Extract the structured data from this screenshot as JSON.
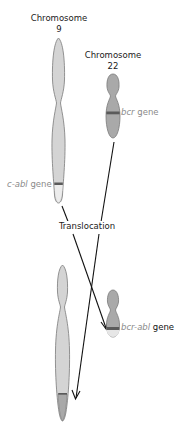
{
  "diagram": {
    "type": "chromosome-translocation",
    "colors": {
      "chromosome9": "#d4d4d4",
      "chromosome22": "#a9a9a9",
      "outline": "#7a7a7a",
      "band": "#5a5a5a",
      "arrow": "#111111",
      "gene_label": "#8a8a8a",
      "text": "#1a1a1a"
    },
    "labels": {
      "chr9_title_line1": "Chromosome",
      "chr9_title_line2": "9",
      "chr22_title_line1": "Chromosome",
      "chr22_title_line2": "22",
      "bcr_gene_name": "bcr",
      "bcr_gene_suffix": " gene",
      "cabl_gene_name": "c-abl",
      "cabl_gene_suffix": " gene",
      "translocation": "Translocation",
      "fusion_gene_name": "bcr-abl",
      "fusion_gene_suffix": " gene"
    }
  }
}
